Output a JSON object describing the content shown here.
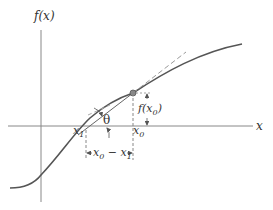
{
  "diagram": {
    "labels": {
      "y_axis": "f(x)",
      "x_axis": "x",
      "x1": "x",
      "x1_sub": "1",
      "x0": "x",
      "x0_sub": "0",
      "theta": "θ",
      "fx0_pre": "f(x",
      "fx0_sub": "0",
      "fx0_post": ")",
      "diff_a": "x",
      "diff_a_sub": "0",
      "diff_op": " − x",
      "diff_b_sub": "1"
    },
    "colors": {
      "curve": "#555555",
      "axes": "#777777",
      "tangent": "#999999",
      "point": "#777777",
      "text": "#333333"
    }
  }
}
